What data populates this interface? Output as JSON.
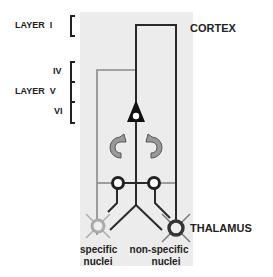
{
  "labels": {
    "layer_top": "LAYER",
    "layer_top_numeral": "I",
    "layer_mid": "LAYER",
    "numeral_iv": "IV",
    "numeral_v": "V",
    "numeral_vi": "VI",
    "cortex": "CORTEX",
    "thalamus": "THALAMUS",
    "specific_line1": "specific",
    "specific_line2": "nuclei",
    "nonspecific_line1": "non-specific",
    "nonspecific_line2": "nuclei"
  },
  "colors": {
    "panel": "#ececec",
    "dark_line": "#2a2a2a",
    "gray_line": "#8a8a8a",
    "text": "#222222"
  }
}
